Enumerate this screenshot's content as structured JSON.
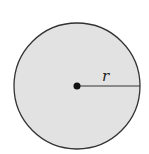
{
  "diagram": {
    "title": "",
    "shape": "circle",
    "fill_color": "#e2e2e2",
    "stroke_color": "#333333",
    "center_label": "",
    "radius_label": "r"
  }
}
